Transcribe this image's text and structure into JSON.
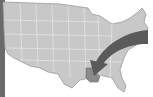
{
  "map": {
    "subject": "United States",
    "colors": {
      "background": "#ffffff",
      "land": "#c8c8c8",
      "borders": "#e8e8e8",
      "outline": "#9a9a9a",
      "highlight_state": "#8a8a8a",
      "arrow": "#5a5a5a",
      "left_bar": "#6a6a6a"
    },
    "highlighted_state": "Louisiana",
    "arrow": {
      "from": "Northeast",
      "to": "Louisiana"
    }
  }
}
